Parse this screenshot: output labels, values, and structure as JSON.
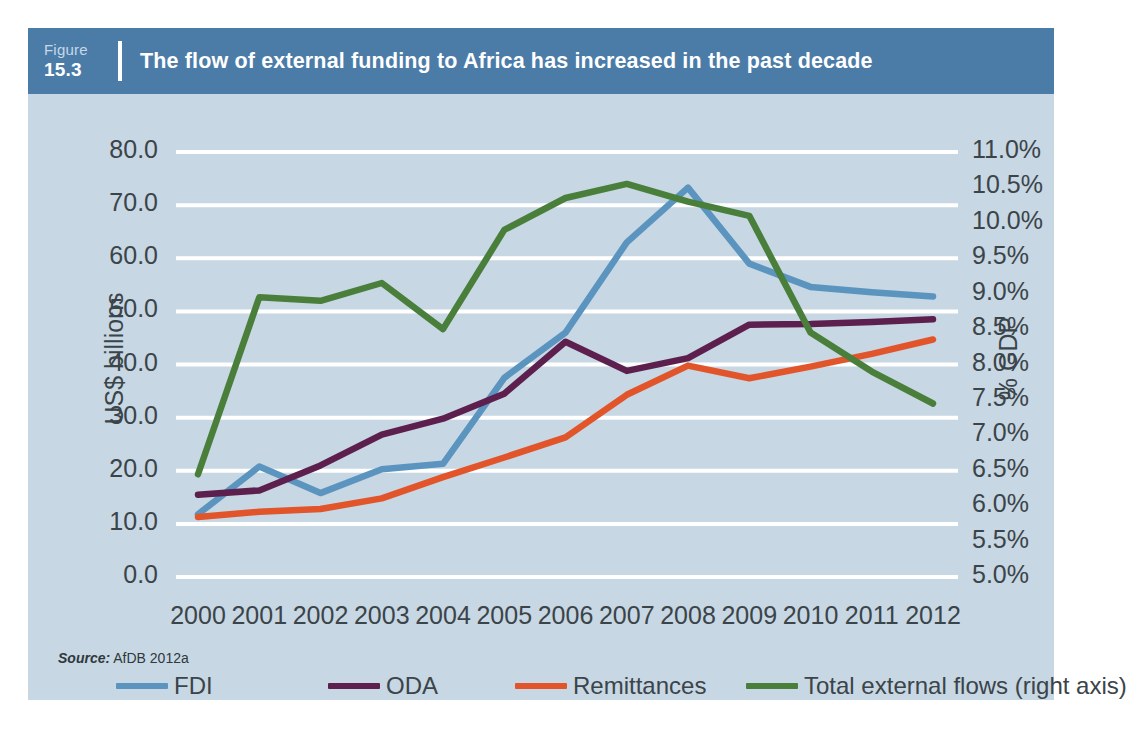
{
  "figure": {
    "badge_word": "Figure",
    "badge_number": "15.3",
    "title": "The flow of external funding to Africa has increased in the past decade"
  },
  "source": {
    "label": "Source:",
    "text": " AfDB 2012a"
  },
  "colors": {
    "header_blue": "#4b7ca8",
    "panel_bg": "#c7d7e3",
    "gridline": "#ffffff",
    "text": "#3b4449",
    "fdi": "#5b95bf",
    "oda": "#5c1f4e",
    "remittances": "#e2552a",
    "total": "#4a7f3b"
  },
  "chart_data": {
    "type": "line",
    "title": "The flow of external funding to Africa has increased in the past decade",
    "xlabel": "",
    "ylabel": "US$ billions",
    "y2label": "% GDP",
    "grid": true,
    "legend_position": "bottom",
    "categories": [
      "2000",
      "2001",
      "2002",
      "2003",
      "2004",
      "2005",
      "2006",
      "2007",
      "2008",
      "2009",
      "2010",
      "2011",
      "2012"
    ],
    "ylim": [
      0.0,
      80.0
    ],
    "yticks": [
      "0.0",
      "10.0",
      "20.0",
      "30.0",
      "40.0",
      "50.0",
      "60.0",
      "70.0",
      "80.0"
    ],
    "y2lim": [
      5.0,
      11.0
    ],
    "y2ticks": [
      "5.0%",
      "5.5%",
      "6.0%",
      "6.5%",
      "7.0%",
      "7.5%",
      "8.0%",
      "8.5%",
      "9.0%",
      "9.5%",
      "10.0%",
      "10.5%",
      "11.0%"
    ],
    "series": [
      {
        "name": "FDI",
        "axis": "left",
        "color": "#5b95bf",
        "values": [
          11.8,
          20.8,
          15.8,
          20.3,
          21.3,
          37.5,
          46.0,
          63.0,
          73.3,
          59.0,
          54.6,
          53.6,
          52.8
        ]
      },
      {
        "name": "ODA",
        "axis": "left",
        "color": "#5c1f4e",
        "values": [
          15.5,
          16.3,
          21.0,
          26.8,
          29.8,
          34.5,
          44.3,
          38.8,
          41.2,
          47.5,
          47.6,
          48.0,
          48.5
        ]
      },
      {
        "name": "Remittances",
        "axis": "left",
        "color": "#e2552a",
        "values": [
          11.3,
          12.3,
          12.8,
          14.8,
          18.8,
          22.5,
          26.3,
          34.3,
          39.8,
          37.4,
          39.6,
          42.0,
          44.7
        ]
      },
      {
        "name": "Total external flows (right axis)",
        "axis": "right",
        "color": "#4a7f3b",
        "values": [
          6.45,
          8.95,
          8.9,
          9.15,
          8.5,
          9.9,
          10.35,
          10.55,
          10.3,
          10.1,
          8.45,
          7.9,
          7.45
        ]
      }
    ]
  },
  "legend": {
    "items": [
      {
        "label": "FDI"
      },
      {
        "label": "ODA"
      },
      {
        "label": "Remittances"
      },
      {
        "label": "Total external flows (right axis)"
      }
    ]
  }
}
